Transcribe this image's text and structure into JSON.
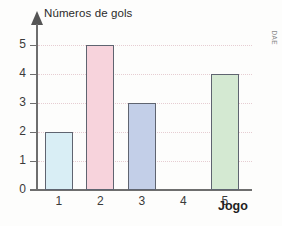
{
  "chart_data": {
    "type": "bar",
    "title": "",
    "ylabel": "Números de gols",
    "xlabel": "Jogo",
    "categories": [
      "1",
      "2",
      "3",
      "4",
      "5"
    ],
    "values": [
      2,
      5,
      3,
      0,
      4
    ],
    "series": [
      {
        "name": "Números de gols",
        "values": [
          2,
          5,
          3,
          0,
          4
        ]
      }
    ],
    "ylim": [
      0,
      5
    ],
    "xlim_categories": 5,
    "yticks": [
      0,
      1,
      2,
      3,
      4,
      5
    ],
    "ytick_labels": [
      "0",
      "1",
      "2",
      "3",
      "4",
      "5"
    ],
    "xtick_labels": [
      "1",
      "2",
      "3",
      "4",
      "5"
    ],
    "grid": true,
    "grid_orientation": "horizontal",
    "grid_style": "dotted",
    "grid_color": "#e6cdd2",
    "legend": false,
    "legend_position": "none",
    "bar_colors": [
      "#d9eef5",
      "#f7d3dc",
      "#c3cfe8",
      "none",
      "#d4e9d2"
    ],
    "bar_border_color": "#5f6470",
    "axis_color": "#6e6e6e",
    "annotations": []
  },
  "figure": {
    "y_axis_title": "Números de gols",
    "x_axis_title": "Jogo",
    "credit": "DAE",
    "background_color": "#fdfdfc"
  }
}
